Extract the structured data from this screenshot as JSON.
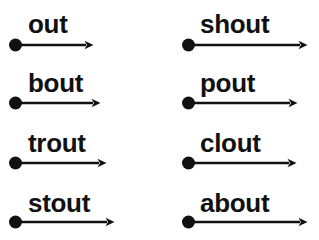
{
  "page": {
    "background_color": "#ffffff",
    "ink_color": "#111111",
    "width": 319,
    "height": 240,
    "columns": 2,
    "rows": 4
  },
  "items": [
    {
      "word": "out",
      "column": 1,
      "row": 1,
      "word_x": 28,
      "word_baseline_y": 32,
      "dot_x": 15,
      "dot_y": 45,
      "dot_r": 6.5,
      "arrow_tip_x": 93
    },
    {
      "word": "bout",
      "column": 1,
      "row": 2,
      "word_x": 28,
      "word_baseline_y": 91,
      "dot_x": 15,
      "dot_y": 103,
      "dot_r": 6.5,
      "arrow_tip_x": 100
    },
    {
      "word": "trout",
      "column": 1,
      "row": 3,
      "word_x": 28,
      "word_baseline_y": 151,
      "dot_x": 15,
      "dot_y": 163,
      "dot_r": 6.5,
      "arrow_tip_x": 106
    },
    {
      "word": "stout",
      "column": 1,
      "row": 4,
      "word_x": 28,
      "word_baseline_y": 211,
      "dot_x": 15,
      "dot_y": 222,
      "dot_r": 6.5,
      "arrow_tip_x": 114
    },
    {
      "word": "shout",
      "column": 2,
      "row": 1,
      "word_x": 200,
      "word_baseline_y": 32,
      "dot_x": 188,
      "dot_y": 45,
      "dot_r": 6.5,
      "arrow_tip_x": 307
    },
    {
      "word": "pout",
      "column": 2,
      "row": 2,
      "word_x": 200,
      "word_baseline_y": 91,
      "dot_x": 188,
      "dot_y": 103,
      "dot_r": 6.5,
      "arrow_tip_x": 297
    },
    {
      "word": "clout",
      "column": 2,
      "row": 3,
      "word_x": 200,
      "word_baseline_y": 151,
      "dot_x": 188,
      "dot_y": 163,
      "dot_r": 6.5,
      "arrow_tip_x": 296
    },
    {
      "word": "about",
      "column": 2,
      "row": 4,
      "word_x": 200,
      "word_baseline_y": 211,
      "dot_x": 188,
      "dot_y": 222,
      "dot_r": 6.5,
      "arrow_tip_x": 307
    }
  ]
}
